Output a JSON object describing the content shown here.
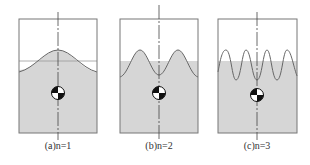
{
  "figure": {
    "panels": [
      {
        "id": "a",
        "label": "(a)",
        "mode_text": "n=1",
        "caption": "(a)n=1",
        "mode": 1
      },
      {
        "id": "b",
        "label": "(b)",
        "mode_text": "n=2",
        "caption": "(b)n=2",
        "mode": 2
      },
      {
        "id": "c",
        "label": "(c)",
        "mode_text": "n=3",
        "caption": "(c)n=3",
        "mode": 3
      }
    ],
    "colors": {
      "liquid": "#d6d6d6",
      "outline": "#777777",
      "wave": "#666666",
      "axis": "#444444",
      "cg": "#111111"
    },
    "icons": {
      "center_of_gravity": "center-of-gravity-icon",
      "symmetry_axis": "dash-dot-axis"
    }
  }
}
